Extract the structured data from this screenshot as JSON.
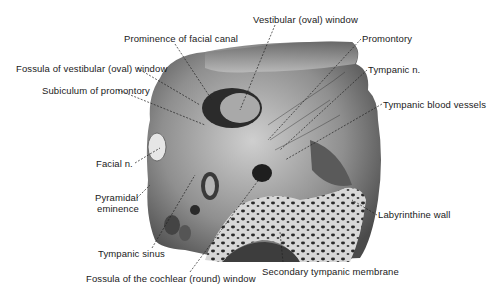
{
  "figure": {
    "labels": [
      {
        "id": "vestibular-window",
        "text": "Vestibular (oval) window",
        "x": 253,
        "y": 14
      },
      {
        "id": "prominence-facial-canal",
        "text": "Prominence of facial canal",
        "x": 124,
        "y": 33
      },
      {
        "id": "promontory",
        "text": "Promontory",
        "x": 362,
        "y": 33
      },
      {
        "id": "fossula-vestibular-window",
        "text": "Fossula of vestibular (oval) window",
        "x": 16,
        "y": 63
      },
      {
        "id": "tympanic-n",
        "text": "Tympanic n.",
        "x": 368,
        "y": 64
      },
      {
        "id": "subiculum-promontory",
        "text": "Subiculum of promontory",
        "x": 42,
        "y": 85
      },
      {
        "id": "tympanic-blood-vessels",
        "text": "Tympanic blood vessels",
        "x": 383,
        "y": 99
      },
      {
        "id": "facial-n",
        "text": "Facial n.",
        "x": 96,
        "y": 158
      },
      {
        "id": "pyramidal-eminence-1",
        "text": "Pyramidal",
        "x": 95,
        "y": 192
      },
      {
        "id": "pyramidal-eminence-2",
        "text": "eminence",
        "x": 97,
        "y": 203
      },
      {
        "id": "labyrinthine-wall",
        "text": "Labyrinthine wall",
        "x": 378,
        "y": 209
      },
      {
        "id": "tympanic-sinus",
        "text": "Tympanic sinus",
        "x": 98,
        "y": 248
      },
      {
        "id": "secondary-tympanic-membrane",
        "text": "Secondary tympanic membrane",
        "x": 262,
        "y": 266
      },
      {
        "id": "fossula-cochlear-window",
        "text": "Fossula of the cochlear (round) window",
        "x": 86,
        "y": 273
      }
    ]
  }
}
